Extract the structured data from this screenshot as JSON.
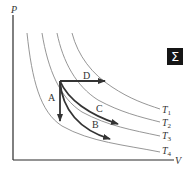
{
  "diagram": {
    "type": "PV-diagram",
    "axes": {
      "y_label": "P",
      "x_label": "V"
    },
    "isotherms": [
      {
        "label": "T",
        "subscript": "1"
      },
      {
        "label": "T",
        "subscript": "2"
      },
      {
        "label": "T",
        "subscript": "3"
      },
      {
        "label": "T",
        "subscript": "4"
      }
    ],
    "processes": [
      {
        "label": "A",
        "description": "vertical down"
      },
      {
        "label": "B",
        "description": "curve to T4"
      },
      {
        "label": "C",
        "description": "curve to T3"
      },
      {
        "label": "D",
        "description": "horizontal right"
      }
    ],
    "badge": {
      "symbol": "Σ"
    },
    "colors": {
      "isotherm": "#8a8a8a",
      "process": "#333333",
      "axis": "#2a2a2a",
      "badge_bg": "#151515"
    }
  }
}
